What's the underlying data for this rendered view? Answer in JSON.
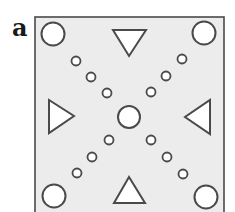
{
  "panel_label": "a",
  "colors": {
    "frame_fill": "#ececec",
    "frame_stroke": "#4a4a4a",
    "shape_fill": "#ffffff",
    "shape_stroke": "#4a4a4a"
  },
  "frame": {
    "x": 35,
    "y": 17,
    "width": 189,
    "height": 200
  },
  "center_circle": {
    "cx": 129,
    "cy": 117,
    "r": 11
  },
  "corner_circles": [
    {
      "position": "top-left",
      "cx": 53,
      "cy": 34,
      "r": 11.5
    },
    {
      "position": "top-right",
      "cx": 204,
      "cy": 33,
      "r": 11.5
    },
    {
      "position": "bottom-left",
      "cx": 54,
      "cy": 196,
      "r": 11.5
    },
    {
      "position": "bottom-right",
      "cx": 206,
      "cy": 197,
      "r": 11.5
    }
  ],
  "small_circles": [
    {
      "diagonal": "top-left",
      "cx": 76,
      "cy": 61,
      "r": 4.5
    },
    {
      "diagonal": "top-left",
      "cx": 91,
      "cy": 77,
      "r": 4.5
    },
    {
      "diagonal": "top-left",
      "cx": 107,
      "cy": 93,
      "r": 4.5
    },
    {
      "diagonal": "top-right",
      "cx": 182,
      "cy": 59,
      "r": 4.5
    },
    {
      "diagonal": "top-right",
      "cx": 166,
      "cy": 76,
      "r": 4.5
    },
    {
      "diagonal": "top-right",
      "cx": 151,
      "cy": 92,
      "r": 4.5
    },
    {
      "diagonal": "bottom-left",
      "cx": 109,
      "cy": 140,
      "r": 4.5
    },
    {
      "diagonal": "bottom-left",
      "cx": 92,
      "cy": 157,
      "r": 4.5
    },
    {
      "diagonal": "bottom-left",
      "cx": 77,
      "cy": 173,
      "r": 4.5
    },
    {
      "diagonal": "bottom-right",
      "cx": 151,
      "cy": 140,
      "r": 4.5
    },
    {
      "diagonal": "bottom-right",
      "cx": 167,
      "cy": 157,
      "r": 4.5
    },
    {
      "diagonal": "bottom-right",
      "cx": 183,
      "cy": 174,
      "r": 4.5
    }
  ],
  "triangles": [
    {
      "position": "top",
      "pointing": "down",
      "points": "113,30 146,30 129,56"
    },
    {
      "position": "left",
      "pointing": "right",
      "points": "49,100 49,133 74,116"
    },
    {
      "position": "right",
      "pointing": "left",
      "points": "210,100 210,134 185,117"
    },
    {
      "position": "bottom",
      "pointing": "up",
      "points": "129,177 114,203 145,203"
    }
  ]
}
